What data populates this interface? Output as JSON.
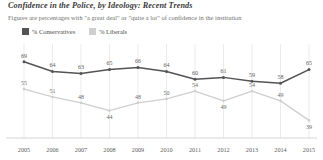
{
  "chart_data": {
    "type": "line",
    "title": "Confidence in the Police, by Ideology: Recent Trends",
    "subtitle": "Figures are percentages with \"a great deal\" or \"quite a lot\" of confidence in the institution",
    "xlabel": "",
    "ylabel": "",
    "x": [
      "2005",
      "2006",
      "2007",
      "2008",
      "2009",
      "2010",
      "2011",
      "2012",
      "2013",
      "2014",
      "2015"
    ],
    "categories": [
      "2005",
      "2006",
      "2007",
      "2008",
      "2009",
      "2010",
      "2011",
      "2012",
      "2013",
      "2014",
      "2015"
    ],
    "ylim": [
      30,
      75
    ],
    "grid": "vertical",
    "legend_position": "top-left",
    "series": [
      {
        "name": "% Conservatives",
        "color": "#545454",
        "values": [
          69,
          64,
          63,
          65,
          66,
          64,
          60,
          61,
          59,
          58,
          65
        ]
      },
      {
        "name": "% Liberals",
        "color": "#cfcfcf",
        "values": [
          55,
          51,
          48,
          44,
          48,
          50,
          54,
          49,
          54,
          49,
          39
        ]
      }
    ]
  },
  "legend": {
    "items": [
      {
        "label": "% Conservatives",
        "color": "#545454"
      },
      {
        "label": "% Liberals",
        "color": "#cfcfcf"
      }
    ]
  },
  "colors": {
    "conservatives": "#545454",
    "liberals": "#cfcfcf",
    "grid": "#e2e2e2",
    "axis": "#cccccc",
    "title": "#3a3a3a",
    "subtitle": "#6f6f6f"
  }
}
